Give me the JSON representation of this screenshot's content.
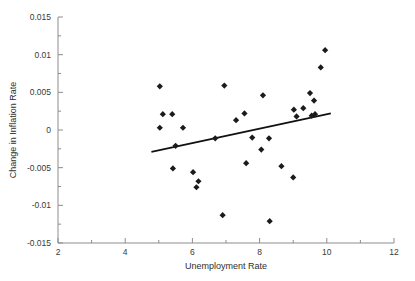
{
  "chart_data": {
    "type": "scatter",
    "title": "",
    "xlabel": "Unemployment Rate",
    "ylabel": "Change in Inflation Rate",
    "xlim": [
      2,
      12
    ],
    "ylim": [
      -0.015,
      0.015
    ],
    "xticks": [
      2,
      4,
      6,
      8,
      10,
      12
    ],
    "xtick_labels": [
      "2",
      "4",
      "6",
      "8",
      "10",
      "12"
    ],
    "yticks": [
      0.015,
      0.01,
      0.005,
      0,
      -0.005,
      -0.01,
      -0.015
    ],
    "ytick_labels": [
      "0.015",
      "0.01",
      "0.005",
      "0",
      "-0.005",
      "-0.01",
      "-0.015"
    ],
    "grid": false,
    "legend": "none",
    "marker_shape": "diamond",
    "marker_color": "#1b1b1b",
    "line_color": "#111111",
    "axis_color": "#8d8d8d",
    "points": [
      {
        "x": 5.03,
        "y": 0.0058
      },
      {
        "x": 5.03,
        "y": 0.0003
      },
      {
        "x": 5.12,
        "y": 0.0021
      },
      {
        "x": 5.4,
        "y": 0.0021
      },
      {
        "x": 5.42,
        "y": -0.0051
      },
      {
        "x": 5.5,
        "y": -0.0021
      },
      {
        "x": 5.72,
        "y": 0.0003
      },
      {
        "x": 6.02,
        "y": -0.0056
      },
      {
        "x": 6.12,
        "y": -0.0076
      },
      {
        "x": 6.18,
        "y": -0.0068
      },
      {
        "x": 6.68,
        "y": -0.0011
      },
      {
        "x": 6.9,
        "y": -0.0113
      },
      {
        "x": 6.95,
        "y": 0.0059
      },
      {
        "x": 7.3,
        "y": 0.0013
      },
      {
        "x": 7.55,
        "y": 0.0022
      },
      {
        "x": 7.6,
        "y": -0.0044
      },
      {
        "x": 7.78,
        "y": -0.001
      },
      {
        "x": 8.05,
        "y": -0.0026
      },
      {
        "x": 8.1,
        "y": 0.0046
      },
      {
        "x": 8.28,
        "y": -0.0011
      },
      {
        "x": 8.3,
        "y": -0.0121
      },
      {
        "x": 8.65,
        "y": -0.0048
      },
      {
        "x": 9.0,
        "y": -0.0063
      },
      {
        "x": 9.02,
        "y": 0.0027
      },
      {
        "x": 9.1,
        "y": 0.0018
      },
      {
        "x": 9.3,
        "y": 0.0029
      },
      {
        "x": 9.5,
        "y": 0.0049
      },
      {
        "x": 9.55,
        "y": 0.0019
      },
      {
        "x": 9.62,
        "y": 0.0039
      },
      {
        "x": 9.65,
        "y": 0.0021
      },
      {
        "x": 9.82,
        "y": 0.0083
      },
      {
        "x": 9.95,
        "y": 0.0106
      }
    ],
    "fit_line": {
      "x_start": 4.78,
      "y_start": -0.0029,
      "x_end": 10.12,
      "y_end": 0.0022
    }
  }
}
